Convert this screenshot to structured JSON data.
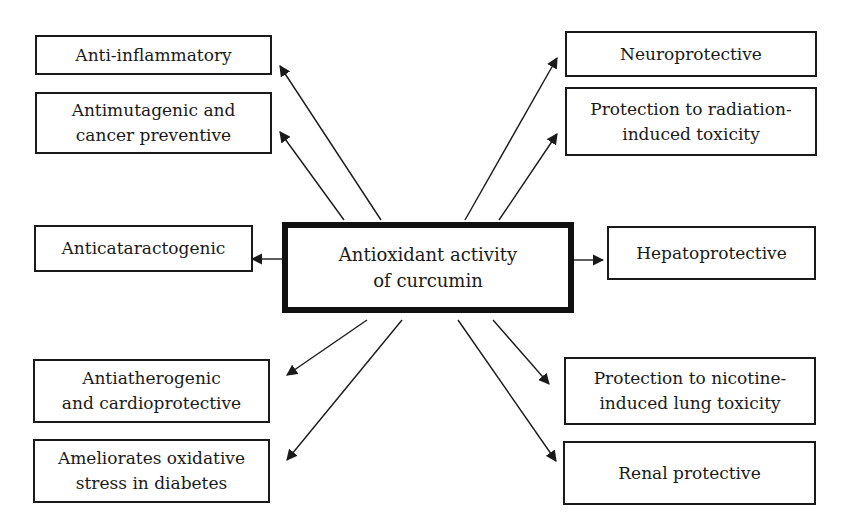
{
  "diagram": {
    "center": {
      "label": "Antioxidant activity\nof curcumin"
    },
    "left": [
      {
        "id": "anti-inflammatory",
        "label": "Anti-inflammatory"
      },
      {
        "id": "antimutagenic",
        "label": "Antimutagenic and\ncancer preventive"
      },
      {
        "id": "anticataractogenic",
        "label": "Anticataractogenic"
      },
      {
        "id": "antiatherogenic",
        "label": "Antiatherogenic\nand cardioprotective"
      },
      {
        "id": "diabetes",
        "label": "Ameliorates oxidative\nstress in diabetes"
      }
    ],
    "right": [
      {
        "id": "neuroprotective",
        "label": "Neuroprotective"
      },
      {
        "id": "radiation",
        "label": "Protection to radiation-\ninduced toxicity"
      },
      {
        "id": "hepatoprotective",
        "label": "Hepatoprotective"
      },
      {
        "id": "nicotine",
        "label": "Protection to nicotine-\ninduced lung toxicity"
      },
      {
        "id": "renal",
        "label": "Renal protective"
      }
    ],
    "colors": {
      "line": "#1a1a1a",
      "background": "#ffffff"
    }
  }
}
